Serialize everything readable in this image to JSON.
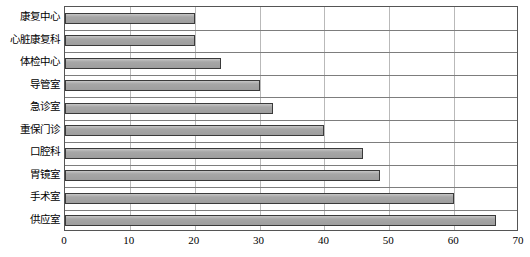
{
  "chart_data": {
    "type": "bar",
    "orientation": "horizontal",
    "title": "",
    "subtitle": "",
    "xlabel": "",
    "ylabel": "",
    "xlim": [
      0,
      70
    ],
    "xticks": [
      0,
      10,
      20,
      30,
      40,
      50,
      60,
      70
    ],
    "grid": true,
    "legend": false,
    "legend_position": "none",
    "categories": [
      "康复中心",
      "心脏康复科",
      "体检中心",
      "导管室",
      "急诊室",
      "重保门诊",
      "口腔科",
      "胃镜室",
      "手术室",
      "供应室"
    ],
    "values": [
      20,
      20,
      24,
      30,
      32,
      40,
      46,
      48.5,
      60,
      66.5
    ],
    "series": [
      {
        "name": "",
        "values": [
          20,
          20,
          24,
          30,
          32,
          40,
          46,
          48.5,
          60,
          66.5
        ]
      }
    ],
    "colors": {
      "bar_fill": "#a6a6a6",
      "bar_border": "#3a3a3a",
      "gridline": "#b9b9b9",
      "frame": "#555555",
      "text": "#000000",
      "background": "#ffffff"
    }
  }
}
